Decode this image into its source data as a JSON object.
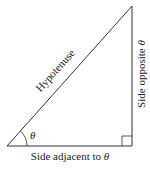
{
  "diagram": {
    "type": "right-triangle",
    "stroke_color": "#333333",
    "text_color": "#222222",
    "vertices": {
      "angle_vertex": [
        7,
        146
      ],
      "right_angle_vertex": [
        132,
        146
      ],
      "top_vertex": [
        132,
        6
      ]
    },
    "labels": {
      "hypotenuse": "Hypotenuse",
      "opposite": "Side opposite θ",
      "adjacent": "Side adjacent to θ",
      "angle": "θ"
    },
    "right_angle_marker_size": 10,
    "angle_arc_radius": 20
  }
}
